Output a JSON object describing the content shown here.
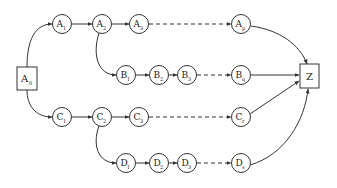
{
  "diagram": {
    "type": "directed-graph",
    "colors": {
      "stroke": "#333333",
      "text": "#222222",
      "background": "#ffffff"
    },
    "start": {
      "id": "A0",
      "letter": "A",
      "sub": "0",
      "shape": "box"
    },
    "end": {
      "id": "Z",
      "letter": "Z",
      "sub": "",
      "shape": "box"
    },
    "rows": [
      {
        "name": "A",
        "nodes": [
          {
            "id": "A1",
            "letter": "A",
            "sub": "1"
          },
          {
            "id": "A2",
            "letter": "A",
            "sub": "2"
          },
          {
            "id": "A3",
            "letter": "A",
            "sub": "3"
          },
          {
            "id": "Ap",
            "letter": "A",
            "sub": "p"
          }
        ]
      },
      {
        "name": "B",
        "nodes": [
          {
            "id": "B1",
            "letter": "B",
            "sub": "1"
          },
          {
            "id": "B2",
            "letter": "B",
            "sub": "2"
          },
          {
            "id": "B3",
            "letter": "B",
            "sub": "3"
          },
          {
            "id": "Bq",
            "letter": "B",
            "sub": "q"
          }
        ]
      },
      {
        "name": "C",
        "nodes": [
          {
            "id": "C1",
            "letter": "C",
            "sub": "1"
          },
          {
            "id": "C2",
            "letter": "C",
            "sub": "2"
          },
          {
            "id": "C3",
            "letter": "C",
            "sub": "3"
          },
          {
            "id": "Cr",
            "letter": "C",
            "sub": "r"
          }
        ]
      },
      {
        "name": "D",
        "nodes": [
          {
            "id": "D1",
            "letter": "D",
            "sub": "1"
          },
          {
            "id": "D2",
            "letter": "D",
            "sub": "2"
          },
          {
            "id": "D3",
            "letter": "D",
            "sub": "3"
          },
          {
            "id": "Ds",
            "letter": "D",
            "sub": "s"
          }
        ]
      }
    ],
    "edges": [
      {
        "from": "A0",
        "to": "A1",
        "style": "solid-curve"
      },
      {
        "from": "A0",
        "to": "C1",
        "style": "solid-curve"
      },
      {
        "from": "A1",
        "to": "A2",
        "style": "solid"
      },
      {
        "from": "A2",
        "to": "A3",
        "style": "solid"
      },
      {
        "from": "A3",
        "to": "Ap",
        "style": "dashed"
      },
      {
        "from": "A2",
        "to": "B1",
        "style": "solid-curve"
      },
      {
        "from": "B1",
        "to": "B2",
        "style": "solid"
      },
      {
        "from": "B2",
        "to": "B3",
        "style": "solid"
      },
      {
        "from": "B3",
        "to": "Bq",
        "style": "dashed"
      },
      {
        "from": "C1",
        "to": "C2",
        "style": "solid"
      },
      {
        "from": "C2",
        "to": "C3",
        "style": "solid"
      },
      {
        "from": "C3",
        "to": "Cr",
        "style": "dashed"
      },
      {
        "from": "C2",
        "to": "D1",
        "style": "solid-curve"
      },
      {
        "from": "D1",
        "to": "D2",
        "style": "solid"
      },
      {
        "from": "D2",
        "to": "D3",
        "style": "solid"
      },
      {
        "from": "D3",
        "to": "Ds",
        "style": "dashed"
      },
      {
        "from": "Ap",
        "to": "Z",
        "style": "solid-curve"
      },
      {
        "from": "Bq",
        "to": "Z",
        "style": "solid"
      },
      {
        "from": "Cr",
        "to": "Z",
        "style": "solid"
      },
      {
        "from": "Ds",
        "to": "Z",
        "style": "solid-curve"
      }
    ]
  }
}
